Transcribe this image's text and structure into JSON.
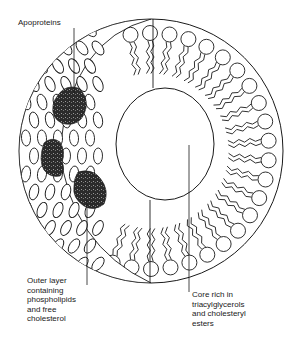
{
  "figure": {
    "labels": {
      "apoproteins": "Apoproteins",
      "outer_layer": "Outer layer\ncontaining\nphospholipids\nand free\ncholesterol",
      "core": "Core rich in\ntriacylglycerols\nand cholesteryl\nesters"
    },
    "colors": {
      "line": "#1a1a1a",
      "apoprotein_fill": "#2b2b2b",
      "background": "#ffffff"
    }
  }
}
